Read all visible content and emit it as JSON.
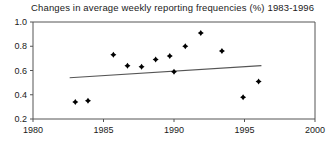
{
  "chart_data": {
    "type": "scatter",
    "title": "Changes in average weekly reporting frequencies (%) 1983-1996",
    "xlabel": "",
    "ylabel": "",
    "xlim": [
      1980,
      2000
    ],
    "ylim": [
      0.2,
      1.0
    ],
    "grid": false,
    "legend": "none",
    "xticks": [
      1980,
      1985,
      1990,
      1995,
      2000
    ],
    "xtick_labels": [
      "1980",
      "1985",
      "1990",
      "1995",
      "2000"
    ],
    "yticks": [
      0.2,
      0.4,
      0.6,
      0.8,
      1.0
    ],
    "ytick_labels": [
      "0.2",
      "0.4",
      "0.6",
      "0.8",
      "1.0"
    ],
    "marker": "filled-diamond",
    "marker_color": "#000000",
    "points": [
      {
        "x": 1983.0,
        "y": 0.34
      },
      {
        "x": 1983.9,
        "y": 0.35
      },
      {
        "x": 1985.7,
        "y": 0.73
      },
      {
        "x": 1986.7,
        "y": 0.64
      },
      {
        "x": 1987.7,
        "y": 0.63
      },
      {
        "x": 1988.7,
        "y": 0.69
      },
      {
        "x": 1989.7,
        "y": 0.72
      },
      {
        "x": 1990.0,
        "y": 0.59
      },
      {
        "x": 1990.8,
        "y": 0.8
      },
      {
        "x": 1991.9,
        "y": 0.91
      },
      {
        "x": 1993.4,
        "y": 0.76
      },
      {
        "x": 1994.9,
        "y": 0.38
      },
      {
        "x": 1996.0,
        "y": 0.51
      }
    ],
    "trend_line": {
      "label": "linear fit",
      "color": "#555555",
      "x_start": 1982.6,
      "y_start": 0.54,
      "x_end": 1996.2,
      "y_end": 0.64
    }
  }
}
